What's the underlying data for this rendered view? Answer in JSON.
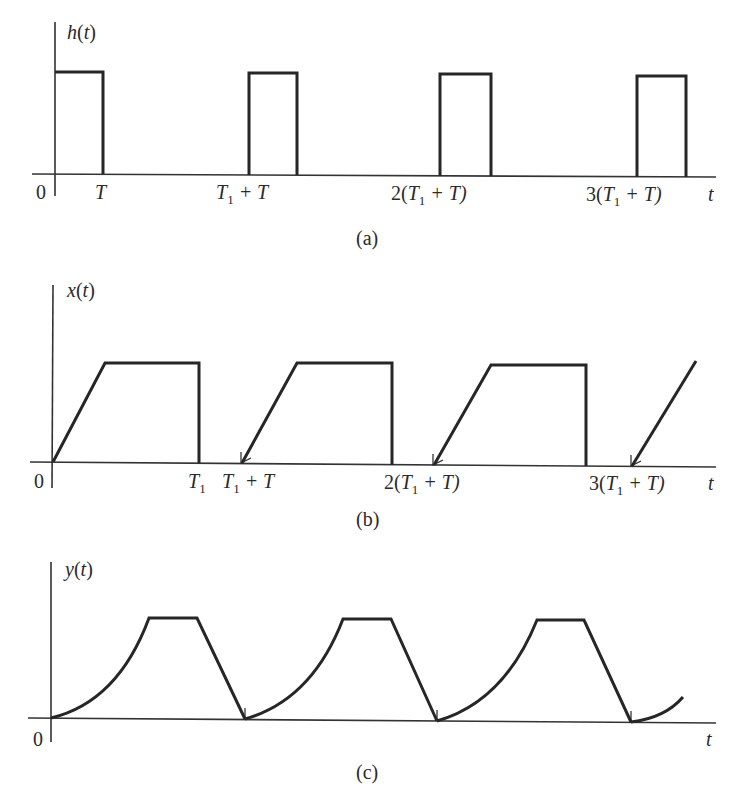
{
  "figure": {
    "panels": [
      {
        "id": "a",
        "caption": "(a)",
        "y_label": "h(t)",
        "x_label": "t",
        "origin_label": "0",
        "ticks": [
          "T",
          "T1 + T",
          "2(T1 + T)",
          "3(T1 + T)"
        ]
      },
      {
        "id": "b",
        "caption": "(b)",
        "y_label": "x(t)",
        "x_label": "t",
        "origin_label": "0",
        "ticks": [
          "T1",
          "T1 + T",
          "2(T1 + T)",
          "3(T1 + T)"
        ]
      },
      {
        "id": "c",
        "caption": "(c)",
        "y_label": "y(t)",
        "x_label": "t",
        "origin_label": "0",
        "ticks": []
      }
    ]
  },
  "labels": {
    "a": {
      "h": "h",
      "open": "(",
      "t": "t",
      "close": ")",
      "zero": "0",
      "T": "T",
      "T1": "T",
      "one": "1",
      "plusT": " + T",
      "two": "2(",
      "three": "3(",
      "tail": " + T)",
      "taxis": "t",
      "cap": "(a)"
    },
    "b": {
      "x": "x",
      "open": "(",
      "t": "t",
      "close": ")",
      "zero": "0",
      "T1": "T",
      "one": "1",
      "plusT": " + T",
      "two": "2(",
      "three": "3(",
      "tail": " + T)",
      "taxis": "t",
      "cap": "(b)"
    },
    "c": {
      "y": "y",
      "open": "(",
      "t": "t",
      "close": ")",
      "zero": "0",
      "taxis": "t",
      "cap": "(c)"
    }
  },
  "colors": {
    "line": "#262626",
    "axis": "#333333",
    "background": "#ffffff"
  }
}
